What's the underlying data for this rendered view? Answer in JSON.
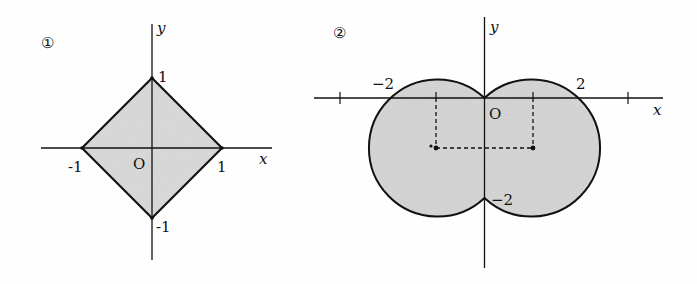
{
  "figure1": {
    "marker": "①",
    "axis_x_label": "x",
    "axis_y_label": "y",
    "origin_label": "O",
    "ticks": {
      "x_neg": "-1",
      "x_pos": "1",
      "y_pos": "1",
      "y_neg": "-1"
    },
    "shape": "square |x|+|y|≤1",
    "fill_color": "#d9d9d9",
    "stroke_color": "#111111"
  },
  "figure2": {
    "marker": "②",
    "axis_x_label": "x",
    "axis_y_label": "y",
    "origin_label": "O",
    "ticks": {
      "x_neg": "−2",
      "x_pos": "2",
      "y_neg": "−2"
    },
    "shape": "union of two disks centered (−1,−1),(1,−1) radius √2",
    "fill_color": "#d4d4d4",
    "stroke_color": "#111111"
  }
}
